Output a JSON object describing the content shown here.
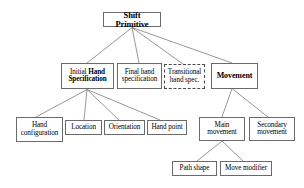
{
  "diagram": {
    "background": "#ffffff",
    "line_color": "#6a6a6a",
    "text_color": "#000000",
    "nodes": {
      "root": {
        "label": "Shift Primitive",
        "style": "solid-bold"
      },
      "initial_hand": {
        "lead": "Initial ",
        "strong": "Hand\nSpecification",
        "style": "solid-mixed-bold"
      },
      "final_hand": {
        "label": "Final hand\nspecification",
        "style": "solid"
      },
      "transitional_hand": {
        "label": "Transitional\nhand spec.",
        "style": "dashed"
      },
      "movement": {
        "label": "Movement",
        "style": "solid-bold"
      },
      "hand_configuration": {
        "label": "Hand\nconfiguration",
        "style": "solid"
      },
      "location": {
        "label": "Location",
        "style": "solid"
      },
      "orientation": {
        "label": "Orientation",
        "style": "solid"
      },
      "hand_point": {
        "label": "Hand point",
        "style": "solid"
      },
      "main_movement": {
        "label": "Main\nmovement",
        "style": "solid"
      },
      "secondary_movement": {
        "label": "Secondary\nmovement",
        "style": "solid"
      },
      "path_shape": {
        "label": "Path shape",
        "style": "solid"
      },
      "move_modifier": {
        "label": "Move modifier",
        "style": "solid"
      }
    },
    "edges": [
      {
        "from": "root",
        "to": "initial_hand"
      },
      {
        "from": "root",
        "to": "final_hand"
      },
      {
        "from": "root",
        "to": "transitional_hand"
      },
      {
        "from": "root",
        "to": "movement"
      },
      {
        "from": "initial_hand",
        "to": "hand_configuration"
      },
      {
        "from": "initial_hand",
        "to": "location"
      },
      {
        "from": "initial_hand",
        "to": "orientation"
      },
      {
        "from": "initial_hand",
        "to": "hand_point"
      },
      {
        "from": "movement",
        "to": "main_movement"
      },
      {
        "from": "movement",
        "to": "secondary_movement"
      },
      {
        "from": "main_movement",
        "to": "path_shape"
      },
      {
        "from": "main_movement",
        "to": "move_modifier"
      }
    ]
  }
}
